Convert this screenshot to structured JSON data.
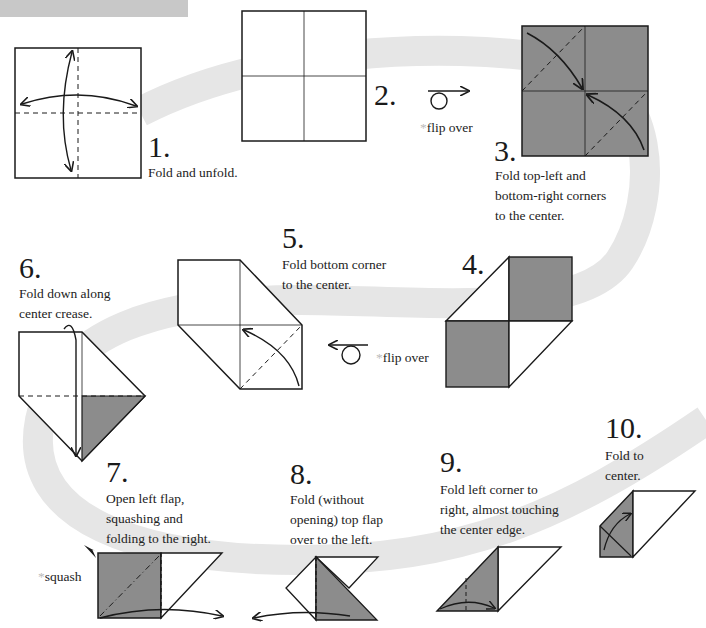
{
  "banner": {
    "color": "#c8c8c8"
  },
  "colors": {
    "paper_colored": "#8c8c8c",
    "paper_white": "#ffffff",
    "line": "#1a1a1a",
    "swoosh": "#e6e6e6"
  },
  "steps": [
    {
      "number": "1.",
      "caption": "Fold and unfold."
    },
    {
      "number": "2.",
      "caption": ""
    },
    {
      "number": "3.",
      "caption": "Fold top-left and\nbottom-right corners\nto the center."
    },
    {
      "number": "4.",
      "caption": ""
    },
    {
      "number": "5.",
      "caption": "Fold bottom corner\nto the center."
    },
    {
      "number": "6.",
      "caption": "Fold down along\ncenter crease."
    },
    {
      "number": "7.",
      "caption": "Open left flap,\nsquashing and\nfolding to the right."
    },
    {
      "number": "8.",
      "caption": "Fold (without\nopening) top flap\nover to the left."
    },
    {
      "number": "9.",
      "caption": "Fold left corner to\nright, almost touching\nthe center edge."
    },
    {
      "number": "10.",
      "caption": "Fold to\ncenter."
    }
  ],
  "notes": {
    "flip_over_1": {
      "star": "*",
      "text": "flip over",
      "icon": "flip-over-right-icon"
    },
    "flip_over_2": {
      "star": "*",
      "text": "flip over",
      "icon": "flip-over-left-icon"
    },
    "squash": {
      "star": "*",
      "text": "squash",
      "icon": "squash-arrowhead-icon"
    }
  }
}
